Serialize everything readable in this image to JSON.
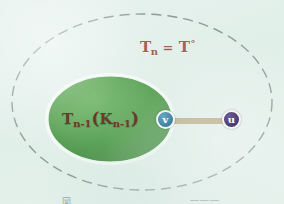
{
  "figure": {
    "background_color": "#e4f0ec",
    "outer_region": {
      "label_main": "T",
      "label_sub": "n",
      "label_eq": "=",
      "label_right": "T",
      "label_right_sup": "°",
      "border_style": "dashed",
      "border_color": "#8a9a94"
    },
    "inner_region": {
      "label_main": "T",
      "label_sub1": "n-1",
      "label_open_paren": "(",
      "label_k": "K",
      "label_sub2": "n-1",
      "label_close_paren": ")",
      "fill_color": "#4f9e4a",
      "border_color": "#ffffff",
      "border_style": "scalloped-dotted"
    },
    "nodes": [
      {
        "id": "v",
        "label": "v",
        "color": "#3f7e9e",
        "ring_color": "#eef6f3"
      },
      {
        "id": "u",
        "label": "u",
        "color": "#4a3c73",
        "ring_color": "#f2f6f3"
      }
    ],
    "edge": {
      "from": "v",
      "to": "u",
      "color": "#c89a4e",
      "highlight_color": "#e8d3a4"
    },
    "caption": {
      "left_fragment": "図",
      "right_fragment": "———"
    }
  }
}
